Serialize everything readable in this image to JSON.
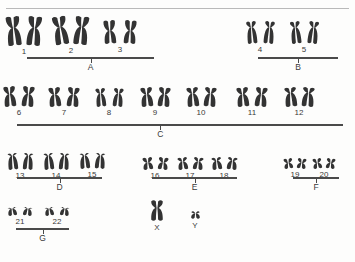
{
  "figure": {
    "ink_color": "#333333",
    "rule_color": "#b9b9b9"
  },
  "pairs": [
    {
      "label": "1",
      "x": 24,
      "y": 16,
      "size": 30,
      "centromere": 0.4,
      "gap": 4,
      "arm_w": 7,
      "left_tilt": -6,
      "right_tilt": 5
    },
    {
      "label": "2",
      "x": 71,
      "y": 16,
      "size": 29,
      "centromere": 0.38,
      "gap": 4,
      "arm_w": 7,
      "left_tilt": -9,
      "right_tilt": 6
    },
    {
      "label": "3",
      "x": 120,
      "y": 20,
      "size": 24,
      "centromere": 0.45,
      "gap": 6,
      "arm_w": 6,
      "left_tilt": -4,
      "right_tilt": 4
    },
    {
      "label": "4",
      "x": 260,
      "y": 21,
      "size": 23,
      "centromere": 0.28,
      "gap": 5,
      "arm_w": 5,
      "left_tilt": -5,
      "right_tilt": 5
    },
    {
      "label": "5",
      "x": 304,
      "y": 21,
      "size": 23,
      "centromere": 0.28,
      "gap": 5,
      "arm_w": 5,
      "left_tilt": -6,
      "right_tilt": 6
    },
    {
      "label": "6",
      "x": 19,
      "y": 86,
      "size": 21,
      "centromere": 0.38,
      "gap": 4,
      "arm_w": 6,
      "left_tilt": -5,
      "right_tilt": 5
    },
    {
      "label": "7",
      "x": 64,
      "y": 87,
      "size": 20,
      "centromere": 0.38,
      "gap": 4,
      "arm_w": 6,
      "left_tilt": -5,
      "right_tilt": 5
    },
    {
      "label": "8",
      "x": 109,
      "y": 88,
      "size": 19,
      "centromere": 0.3,
      "gap": 5,
      "arm_w": 5,
      "left_tilt": -5,
      "right_tilt": 5
    },
    {
      "label": "9",
      "x": 155,
      "y": 87,
      "size": 20,
      "centromere": 0.36,
      "gap": 3,
      "arm_w": 6,
      "left_tilt": -5,
      "right_tilt": 5
    },
    {
      "label": "10",
      "x": 201,
      "y": 87,
      "size": 20,
      "centromere": 0.33,
      "gap": 3,
      "arm_w": 6,
      "left_tilt": -5,
      "right_tilt": 5
    },
    {
      "label": "11",
      "x": 252,
      "y": 87,
      "size": 20,
      "centromere": 0.36,
      "gap": 4,
      "arm_w": 6,
      "left_tilt": -5,
      "right_tilt": 5
    },
    {
      "label": "12",
      "x": 299,
      "y": 87,
      "size": 20,
      "centromere": 0.3,
      "gap": 3,
      "arm_w": 6,
      "left_tilt": -5,
      "right_tilt": 5
    },
    {
      "label": "13",
      "x": 20,
      "y": 153,
      "size": 17,
      "centromere": 0.17,
      "gap": 3,
      "arm_w": 5,
      "left_tilt": -5,
      "right_tilt": 4
    },
    {
      "label": "14",
      "x": 56,
      "y": 153,
      "size": 17,
      "centromere": 0.17,
      "gap": 3,
      "arm_w": 5,
      "left_tilt": -5,
      "right_tilt": 4
    },
    {
      "label": "15",
      "x": 92,
      "y": 153,
      "size": 16,
      "centromere": 0.17,
      "gap": 3,
      "arm_w": 5,
      "left_tilt": -5,
      "right_tilt": 4
    },
    {
      "label": "16",
      "x": 155,
      "y": 157,
      "size": 13,
      "centromere": 0.42,
      "gap": 3,
      "arm_w": 5,
      "left_tilt": -7,
      "right_tilt": 7
    },
    {
      "label": "17",
      "x": 190,
      "y": 157,
      "size": 13,
      "centromere": 0.35,
      "gap": 3,
      "arm_w": 5,
      "left_tilt": -7,
      "right_tilt": 7
    },
    {
      "label": "18",
      "x": 224,
      "y": 157,
      "size": 13,
      "centromere": 0.3,
      "gap": 3,
      "arm_w": 5,
      "left_tilt": -7,
      "right_tilt": 7
    },
    {
      "label": "19",
      "x": 295,
      "y": 158,
      "size": 11,
      "centromere": 0.45,
      "gap": 2,
      "arm_w": 4.5,
      "left_tilt": -8,
      "right_tilt": 8
    },
    {
      "label": "20",
      "x": 324,
      "y": 158,
      "size": 11,
      "centromere": 0.45,
      "gap": 2,
      "arm_w": 4.5,
      "left_tilt": -8,
      "right_tilt": 8
    },
    {
      "label": "21",
      "x": 20,
      "y": 207,
      "size": 9,
      "centromere": 0.2,
      "gap": 4,
      "arm_w": 4.5,
      "left_tilt": -8,
      "right_tilt": 8
    },
    {
      "label": "22",
      "x": 57,
      "y": 207,
      "size": 9,
      "centromere": 0.2,
      "gap": 4,
      "arm_w": 4.5,
      "left_tilt": -8,
      "right_tilt": 8
    }
  ],
  "groups": [
    {
      "letter": "A",
      "x": 27,
      "y": 57,
      "width": 127,
      "tick_frac": 0.5
    },
    {
      "letter": "B",
      "x": 258,
      "y": 57,
      "width": 80,
      "tick_frac": 0.5
    },
    {
      "letter": "C",
      "x": 17,
      "y": 124,
      "width": 326,
      "tick_frac": 0.44
    },
    {
      "letter": "D",
      "x": 17,
      "y": 177,
      "width": 85,
      "tick_frac": 0.5
    },
    {
      "letter": "E",
      "x": 152,
      "y": 177,
      "width": 85,
      "tick_frac": 0.5
    },
    {
      "letter": "F",
      "x": 293,
      "y": 177,
      "width": 46,
      "tick_frac": 0.5
    },
    {
      "letter": "G",
      "x": 16,
      "y": 228,
      "width": 53,
      "tick_frac": 0.5
    }
  ],
  "sex_chromosomes": [
    {
      "label": "X",
      "x": 157,
      "y": 200,
      "size": 21,
      "centromere": 0.38,
      "arm_w": 6,
      "tilt": 0
    },
    {
      "label": "Y",
      "x": 195,
      "y": 211,
      "size": 8,
      "centromere": 0.3,
      "arm_w": 4.5,
      "tilt": 0
    }
  ]
}
